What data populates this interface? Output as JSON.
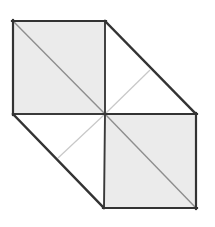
{
  "figure": {
    "canvas": {
      "width": 215,
      "height": 227,
      "background": "#ffffff"
    },
    "colors": {
      "face_fill": "#ebebeb",
      "face_fill_white": "#ffffff",
      "edge_stroke": "#333333",
      "inner_diagonal_stroke": "#c8c8c8",
      "dark_diagonal_stroke": "#555555"
    },
    "stroke_widths": {
      "outline": 2.2,
      "inner_edge": 1.8,
      "light_diagonal": 1.2,
      "face_diagonal": 1.4
    },
    "vertices": {
      "top_left": "13,21",
      "top_mid": "105,21",
      "left_mid": "13,114",
      "center": "105,114",
      "right_upper": "196,114",
      "bottom_mid": "104,208",
      "bottom_right": "196,208",
      "far_top_right": "150,70"
    },
    "faces": [
      {
        "name": "top-left-square",
        "points": "13,21 105,21 105,114 13,114",
        "fill": "#ebebeb"
      },
      {
        "name": "bottom-right-square",
        "points": "105,114 196,114 196,208 104,208",
        "fill": "#ebebeb"
      },
      {
        "name": "upper-right-triangle",
        "points": "105,21 196,114 105,114",
        "fill": "#ffffff"
      },
      {
        "name": "lower-left-triangle",
        "points": "13,114 105,114 104,208",
        "fill": "#ffffff"
      }
    ],
    "edges": [
      {
        "name": "top-edge",
        "from": "13,21",
        "to": "105,21"
      },
      {
        "name": "left-edge",
        "from": "13,21",
        "to": "13,114"
      },
      {
        "name": "vertical-middle-edge",
        "from": "105,21",
        "to": "105,114"
      },
      {
        "name": "horizontal-middle-left-edge",
        "from": "13,114",
        "to": "105,114"
      },
      {
        "name": "horizontal-middle-right-edge",
        "from": "105,114",
        "to": "196,114"
      },
      {
        "name": "vertical-right-edge",
        "from": "196,114",
        "to": "196,208"
      },
      {
        "name": "bottom-edge",
        "from": "104,208",
        "to": "196,208"
      },
      {
        "name": "vertical-bottom-middle-edge",
        "from": "105,114",
        "to": "104,208"
      },
      {
        "name": "upper-right-slant-edge",
        "from": "105,21",
        "to": "196,114"
      },
      {
        "name": "lower-left-slant-edge",
        "from": "13,114",
        "to": "104,208"
      }
    ],
    "diagonals": [
      {
        "name": "top-left-face-diagonal",
        "from": "13,21",
        "to": "105,114",
        "stroke": "#888888"
      },
      {
        "name": "bottom-right-face-diagonal",
        "from": "105,114",
        "to": "196,208",
        "stroke": "#888888"
      },
      {
        "name": "center-to-upper-right-diagonal",
        "from": "105,114",
        "to": "150,70",
        "stroke": "#c8c8c8"
      },
      {
        "name": "center-to-lower-left-diagonal",
        "from": "105,114",
        "to": "58,158",
        "stroke": "#c8c8c8"
      }
    ]
  }
}
